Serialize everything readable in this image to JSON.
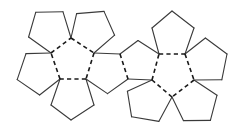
{
  "diagram": {
    "title": "",
    "colors": {
      "background": "#ffffff",
      "cut_line": "#3a3a3a",
      "fold_line": "#1a1a1a"
    },
    "faces": [
      {
        "id": "left-center",
        "points": [
          [
            71,
            38
          ],
          [
            94,
            53
          ],
          [
            86,
            79
          ],
          [
            60,
            79
          ],
          [
            51,
            53
          ]
        ]
      },
      {
        "id": "left-petal-top-right",
        "points": [
          [
            71,
            38
          ],
          [
            94,
            53
          ],
          [
            114.6,
            35.2
          ],
          [
            104,
            11.4
          ],
          [
            76.6,
            13.6
          ]
        ]
      },
      {
        "id": "left-petal-right",
        "points": [
          [
            94,
            53
          ],
          [
            120,
            54
          ],
          [
            128,
            79
          ],
          [
            107.5,
            93.6
          ],
          [
            86,
            79
          ]
        ]
      },
      {
        "id": "left-petal-bottom",
        "points": [
          [
            86,
            79
          ],
          [
            94,
            105
          ],
          [
            71,
            120
          ],
          [
            51,
            105
          ],
          [
            60,
            79
          ]
        ]
      },
      {
        "id": "left-petal-left",
        "points": [
          [
            60,
            79
          ],
          [
            51,
            53
          ],
          [
            26,
            53.6
          ],
          [
            17.2,
            79.6
          ],
          [
            39.6,
            95
          ]
        ]
      },
      {
        "id": "left-petal-top-left",
        "points": [
          [
            51,
            53
          ],
          [
            71,
            38
          ],
          [
            63,
            11.8
          ],
          [
            35.8,
            12.2
          ],
          [
            28.6,
            37
          ]
        ]
      },
      {
        "id": "right-center",
        "points": [
          [
            159,
            54
          ],
          [
            185,
            54
          ],
          [
            194,
            80
          ],
          [
            172,
            97
          ],
          [
            152,
            80
          ]
        ]
      },
      {
        "id": "right-petal-top",
        "points": [
          [
            159,
            54
          ],
          [
            185,
            54
          ],
          [
            194,
            28
          ],
          [
            172,
            11
          ],
          [
            152,
            28
          ]
        ]
      },
      {
        "id": "right-petal-right",
        "points": [
          [
            185,
            54
          ],
          [
            194,
            80
          ],
          [
            221.8,
            79.8
          ],
          [
            227,
            54
          ],
          [
            205.4,
            38
          ]
        ]
      },
      {
        "id": "right-petal-bottom-right",
        "points": [
          [
            194,
            80
          ],
          [
            217,
            95.2
          ],
          [
            210.4,
            120.4
          ],
          [
            183.4,
            120.6
          ],
          [
            172,
            97
          ]
        ]
      },
      {
        "id": "right-petal-bottom-left",
        "points": [
          [
            172,
            97
          ],
          [
            158.8,
            121.4
          ],
          [
            131.6,
            116.8
          ],
          [
            127.4,
            91.2
          ],
          [
            152,
            80
          ]
        ]
      },
      {
        "id": "right-petal-left",
        "points": [
          [
            152,
            80
          ],
          [
            159,
            54
          ],
          [
            138,
            40.5
          ],
          [
            120,
            54
          ],
          [
            128,
            79
          ]
        ]
      }
    ],
    "fold_edges": [
      [
        [
          71,
          38
        ],
        [
          94,
          53
        ]
      ],
      [
        [
          94,
          53
        ],
        [
          86,
          79
        ]
      ],
      [
        [
          86,
          79
        ],
        [
          60,
          79
        ]
      ],
      [
        [
          60,
          79
        ],
        [
          51,
          53
        ]
      ],
      [
        [
          51,
          53
        ],
        [
          71,
          38
        ]
      ],
      [
        [
          159,
          54
        ],
        [
          185,
          54
        ]
      ],
      [
        [
          185,
          54
        ],
        [
          194,
          80
        ]
      ],
      [
        [
          194,
          80
        ],
        [
          172,
          97
        ]
      ],
      [
        [
          172,
          97
        ],
        [
          152,
          80
        ]
      ],
      [
        [
          152,
          80
        ],
        [
          159,
          54
        ]
      ],
      [
        [
          120,
          54
        ],
        [
          128,
          79
        ]
      ]
    ],
    "line_styles": {
      "cut": "solid",
      "fold": "dashed"
    }
  }
}
